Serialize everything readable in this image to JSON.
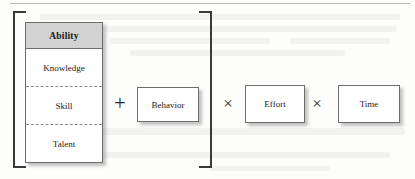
{
  "figure": {
    "type": "formula-diagram",
    "background_color": "#fdfdfc",
    "ink_color": "#1a1a1a",
    "header_fill": "#d2d2d2",
    "border_color": "#6d6d6d",
    "bracket_color": "#3a3a3a"
  },
  "ability_table": {
    "header": "Ability",
    "rows": [
      {
        "label": "Knowledge",
        "divider_above": false
      },
      {
        "label": "Skill",
        "divider_above": true
      },
      {
        "label": "Talent",
        "divider_above": true
      }
    ]
  },
  "brackets": {
    "open": "[",
    "close": "]"
  },
  "operators": {
    "plus": "+",
    "times_first": "×",
    "times_second": "×"
  },
  "terms": [
    {
      "label": "Behavior"
    },
    {
      "label": "Effort"
    },
    {
      "label": "Time"
    }
  ]
}
